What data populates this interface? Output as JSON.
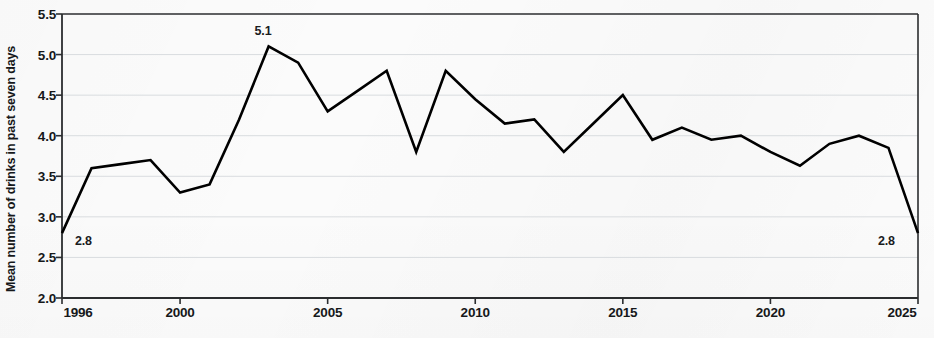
{
  "chart_data": {
    "type": "line",
    "title": "",
    "subtitle": "",
    "xlabel": "",
    "ylabel": "Mean number of drinks in past seven days",
    "xlim": [
      1996,
      2025
    ],
    "ylim": [
      2.0,
      5.5
    ],
    "grid": true,
    "legend": false,
    "legend_position": "none",
    "line_color": "#000000",
    "x_tick_labels": [
      "1996",
      "2000",
      "2005",
      "2010",
      "2015",
      "2020",
      "2025"
    ],
    "x_ticks": [
      1996,
      2000,
      2005,
      2010,
      2015,
      2020,
      2025
    ],
    "y_tick_labels": [
      "2.0",
      "2.5",
      "3.0",
      "3.5",
      "4.0",
      "4.5",
      "5.0",
      "5.5"
    ],
    "y_ticks": [
      2.0,
      2.5,
      3.0,
      3.5,
      4.0,
      4.5,
      5.0,
      5.5
    ],
    "x": [
      1996,
      1997,
      1998,
      1999,
      2000,
      2001,
      2002,
      2003,
      2004,
      2005,
      2006,
      2007,
      2008,
      2009,
      2010,
      2011,
      2012,
      2013,
      2014,
      2015,
      2016,
      2017,
      2018,
      2019,
      2020,
      2021,
      2022,
      2023,
      2024,
      2025
    ],
    "values": [
      2.8,
      3.6,
      3.65,
      3.7,
      3.3,
      3.4,
      4.2,
      5.1,
      4.9,
      4.3,
      4.55,
      4.8,
      3.8,
      4.8,
      4.45,
      4.15,
      4.2,
      3.8,
      4.15,
      4.5,
      3.95,
      4.1,
      3.95,
      4.0,
      3.8,
      3.63,
      3.9,
      4.0,
      3.85,
      2.8
    ],
    "annotations": [
      {
        "text": "2.8",
        "x": 1996,
        "y": 2.8,
        "position": "right-below"
      },
      {
        "text": "5.1",
        "x": 2003,
        "y": 5.1,
        "position": "above"
      },
      {
        "text": "2.8",
        "x": 2025,
        "y": 2.8,
        "position": "left-below"
      }
    ]
  }
}
